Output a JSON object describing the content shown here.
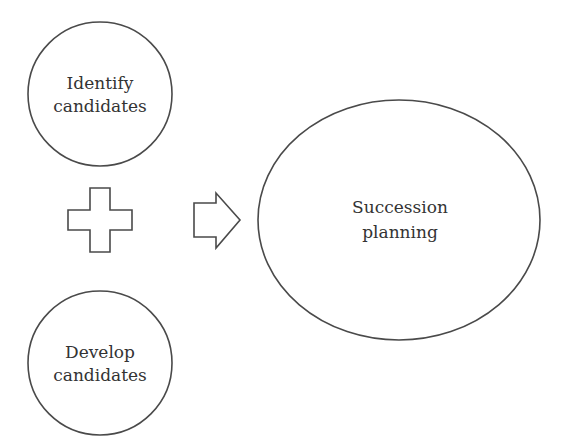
{
  "diagram": {
    "nodes": [
      {
        "id": "identify",
        "lines": [
          "Identify",
          "candidates"
        ],
        "shape": "circle"
      },
      {
        "id": "develop",
        "lines": [
          "Develop",
          "candidates"
        ],
        "shape": "circle"
      },
      {
        "id": "succession",
        "lines": [
          "Succession",
          "planning"
        ],
        "shape": "ellipse"
      }
    ],
    "operators": [
      {
        "id": "plus",
        "symbol": "plus-outline",
        "meaning": "combine"
      },
      {
        "id": "arrow",
        "symbol": "right-arrow-outline",
        "meaning": "leads to"
      }
    ],
    "colors": {
      "stroke": "#4a4a4a",
      "text": "#333333",
      "background": "#ffffff"
    }
  }
}
